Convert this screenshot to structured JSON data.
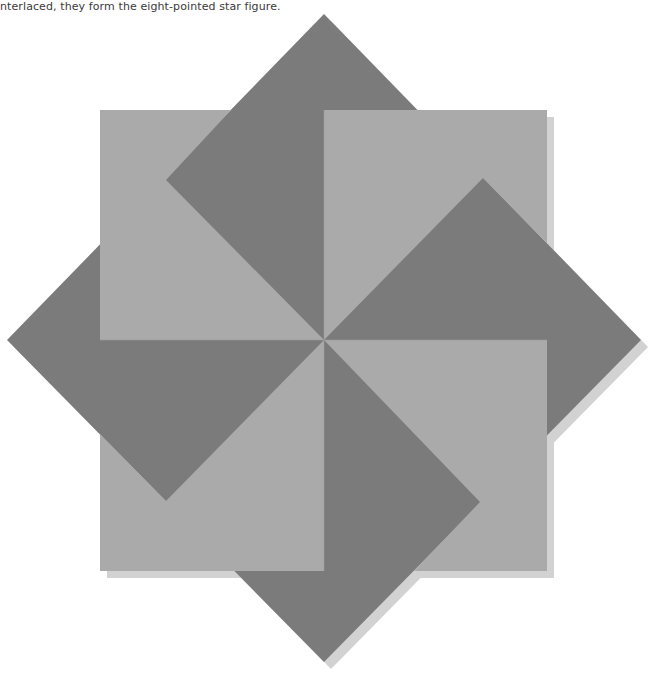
{
  "caption": {
    "text": "nterlaced, they form the eight-pointed star figure."
  },
  "figure": {
    "colors": {
      "dark": "#7b7b7b",
      "light": "#aaaaaa",
      "shadow": "#d2d2d2",
      "background": "#ffffff"
    },
    "center": [
      324,
      340
    ],
    "square": {
      "x1": 100,
      "y1": 110,
      "x2": 547,
      "y2": 571
    },
    "diamond": {
      "top": [
        324,
        14
      ],
      "right": [
        641,
        340
      ],
      "bottom": [
        324,
        662
      ],
      "left": [
        7,
        340
      ]
    },
    "arrow_points": [
      [
        166,
        180
      ],
      [
        483,
        178
      ],
      [
        480,
        502
      ],
      [
        166,
        501
      ]
    ]
  }
}
